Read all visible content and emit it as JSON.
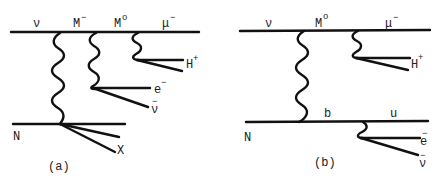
{
  "colors": {
    "ink": "#111111",
    "background": "#ffffff"
  },
  "diagram_a": {
    "caption": "(a)",
    "top_labels": {
      "nu": "ν",
      "m_minus": "M",
      "m_minus_sup": "−",
      "m_zero": "M",
      "m_zero_sup": "o",
      "mu": "μ",
      "mu_sup": "−"
    },
    "h_plus": "H",
    "h_plus_sup": "+",
    "e_minus": "e",
    "e_minus_sup": "−",
    "nubar": "ν",
    "nubar_bar": "−",
    "nucleon": "N",
    "x_label": "X"
  },
  "diagram_b": {
    "caption": "(b)",
    "top_labels": {
      "nu": "ν",
      "m_zero": "M",
      "m_zero_sup": "o",
      "mu": "μ",
      "mu_sup": "−"
    },
    "h_plus": "H",
    "h_plus_sup": "+",
    "quark_b": "b",
    "quark_u": "u",
    "nucleon": "N",
    "e_minus": "e",
    "e_minus_sup": "−",
    "nubar": "ν",
    "nubar_bar": "−"
  }
}
